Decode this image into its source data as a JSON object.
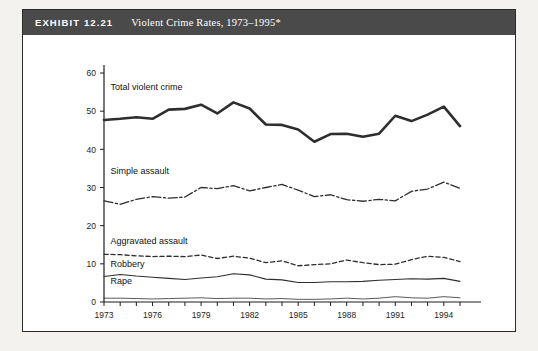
{
  "exhibit": {
    "label": "EXHIBIT 12.21",
    "title": "Violent Crime Rates, 1973–1995*"
  },
  "colors": {
    "header_bg": "#4a4a4a",
    "header_text": "#ffffff",
    "frame": "#2b2b2b",
    "axis": "#1d1d1d",
    "line": "#2e2e2e",
    "page_bg": "#f3f2ef"
  },
  "chart_data": {
    "type": "line",
    "title": "Violent Crime Rates, 1973–1995*",
    "xlabel": "",
    "ylabel": "",
    "xlim": [
      1973,
      1995
    ],
    "ylim": [
      0,
      60
    ],
    "grid": false,
    "legend": "inline-labels",
    "yticks": [
      0,
      10,
      20,
      30,
      40,
      50,
      60
    ],
    "xticks": [
      1973,
      1976,
      1979,
      1982,
      1985,
      1988,
      1991,
      1994
    ],
    "x": [
      1973,
      1974,
      1975,
      1976,
      1977,
      1978,
      1979,
      1980,
      1981,
      1982,
      1983,
      1984,
      1985,
      1986,
      1987,
      1988,
      1989,
      1990,
      1991,
      1992,
      1993,
      1994,
      1995
    ],
    "series": [
      {
        "name": "Total violent crime",
        "style": "solid-thick",
        "label_x": 1973.4,
        "label_y": 55.5,
        "values": [
          47.7,
          48.0,
          48.4,
          48.0,
          50.4,
          50.6,
          51.7,
          49.4,
          52.3,
          50.7,
          46.5,
          46.4,
          45.2,
          42.0,
          44.0,
          44.1,
          43.3,
          44.1,
          48.8,
          47.4,
          49.1,
          51.2,
          46.1
        ]
      },
      {
        "name": "Simple assault",
        "style": "dash-dot",
        "label_x": 1973.4,
        "label_y": 33.5,
        "values": [
          26.5,
          25.6,
          26.9,
          27.6,
          27.2,
          27.5,
          30.0,
          29.7,
          30.5,
          29.1,
          30.0,
          30.8,
          29.3,
          27.6,
          28.1,
          26.8,
          26.4,
          26.9,
          26.5,
          29.0,
          29.6,
          31.4,
          29.8
        ]
      },
      {
        "name": "Aggravated assault",
        "style": "dashed",
        "label_x": 1973.4,
        "label_y": 15.2,
        "values": [
          12.5,
          12.4,
          12.1,
          11.9,
          12.0,
          11.9,
          12.3,
          11.4,
          12.0,
          11.5,
          10.3,
          10.8,
          9.5,
          9.8,
          10.0,
          11.0,
          10.3,
          9.8,
          9.9,
          11.1,
          12.0,
          11.7,
          10.6
        ]
      },
      {
        "name": "Robbery",
        "style": "solid-thin",
        "label_x": 1973.4,
        "label_y": 9.2,
        "values": [
          6.7,
          7.2,
          6.8,
          6.5,
          6.2,
          5.9,
          6.3,
          6.6,
          7.4,
          7.1,
          6.0,
          5.8,
          5.1,
          5.1,
          5.3,
          5.3,
          5.4,
          5.7,
          5.9,
          6.1,
          6.0,
          6.2,
          5.4
        ]
      },
      {
        "name": "Rape",
        "style": "solid-hair",
        "label_x": 1973.4,
        "label_y": 4.6,
        "values": [
          1.0,
          1.0,
          0.9,
          0.8,
          0.9,
          1.0,
          1.1,
          0.9,
          1.0,
          1.0,
          0.8,
          0.9,
          0.7,
          0.7,
          0.8,
          1.0,
          0.8,
          1.0,
          1.4,
          1.1,
          1.0,
          1.4,
          1.1
        ]
      }
    ]
  }
}
